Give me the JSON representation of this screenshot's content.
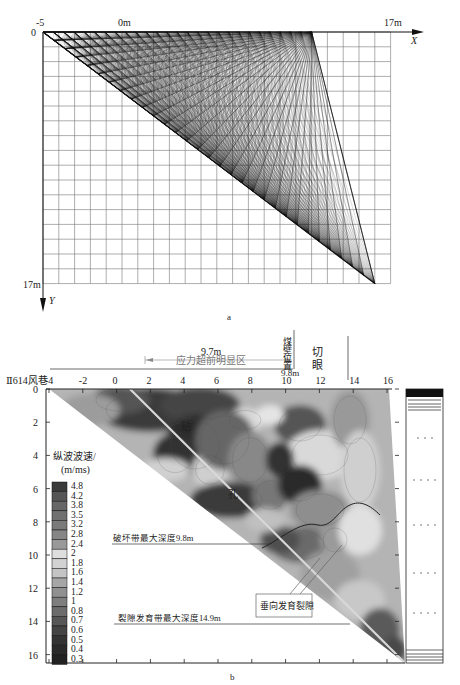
{
  "page_header_fragment": "",
  "chart_data": [
    {
      "id": "a",
      "type": "diagram",
      "title": "Ray path coverage (tomography rays)",
      "caption": "a",
      "x_axis": {
        "label": "X",
        "tick_labels": [
          "-5",
          "0m",
          "17m"
        ],
        "range": [
          -5,
          17
        ]
      },
      "y_axis": {
        "label": "Y",
        "tick_labels": [
          "0",
          "17m"
        ],
        "range": [
          0,
          17
        ]
      },
      "grid": true,
      "grid_cells_x": 22,
      "grid_cells_y": 17,
      "fan_apex": {
        "x": 12,
        "y": 0
      },
      "ray_sink": {
        "x": 16,
        "y": 17
      },
      "diagonal_start": {
        "x": -5,
        "y": 0
      }
    },
    {
      "id": "b",
      "type": "heatmap",
      "title": "P-wave velocity contour section",
      "caption": "b",
      "left_label": "Ⅱ614风巷",
      "x_ticks": [
        "-4",
        "-2",
        "0",
        "2",
        "4",
        "6",
        "8",
        "10",
        "12",
        "14",
        "16"
      ],
      "y_ticks": [
        "0",
        "2",
        "4",
        "6",
        "8",
        "10",
        "12",
        "14",
        "16"
      ],
      "x_range": [
        -4,
        16
      ],
      "y_range": [
        0,
        16.5
      ],
      "colorbar": {
        "title_line1": "纵波波速/",
        "title_line2": "(m/ms)",
        "levels": [
          "4.8",
          "4.2",
          "3.8",
          "3.5",
          "3.2",
          "2.8",
          "2.4",
          "2",
          "1.8",
          "1.6",
          "1.4",
          "1.2",
          "1",
          "0.8",
          "0.7",
          "0.6",
          "0.5",
          "0.4",
          "0.3"
        ],
        "colors": [
          "#3a3a3a",
          "#555555",
          "#666666",
          "#707070",
          "#7a7a7a",
          "#868686",
          "#999999",
          "#dedede",
          "#d2d2d2",
          "#c4c4c4",
          "#a6a6a6",
          "#909090",
          "#7e7e7e",
          "#6c6c6c",
          "#565656",
          "#444444",
          "#333333",
          "#2a2a2a",
          "#222222"
        ]
      },
      "annotations": {
        "stress_zone_distance": "9.7m",
        "stress_zone_label": "应力超前明显区",
        "coal_wall_label": "煤壁位置",
        "coal_wall_distance": "9.8m",
        "cut_label": "切眼",
        "borehole_char_1": "钻",
        "borehole_char_2": "孔",
        "damage_zone": "破坏带最大深度9.8m",
        "fracture_zone": "裂隙发育带最大深度14.9m",
        "vertical_fracture": "垂向发育裂隙"
      },
      "depth_lines": {
        "damage_zone_depth": 9.8,
        "fracture_zone_depth": 14.9
      },
      "coal_wall_x": 9.8,
      "cut_x": 12.8
    }
  ]
}
